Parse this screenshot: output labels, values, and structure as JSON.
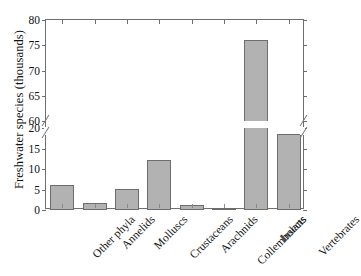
{
  "chart_data": {
    "type": "bar",
    "title": "",
    "xlabel": "",
    "ylabel": "Freshwater species (thousands)",
    "categories": [
      "Other phyla",
      "Annelids",
      "Molluscs",
      "Crustaceans",
      "Arachnids",
      "Collembolans",
      "Insects",
      "Vertebrates"
    ],
    "values": [
      6.1,
      1.8,
      5.1,
      12.2,
      1.2,
      0.4,
      76.0,
      18.6
    ],
    "ylim": [
      0,
      80
    ],
    "axis_break": {
      "present": true,
      "lower_segment": [
        0,
        20
      ],
      "upper_segment": [
        60,
        80
      ]
    },
    "yticks_lower": [
      "0",
      "5",
      "10",
      "15",
      "20"
    ],
    "yticks_upper": [
      "60",
      "65",
      "70",
      "75",
      "80"
    ],
    "grid": false,
    "legend": "none",
    "bar_fill_color": "#b2b2b2",
    "bar_edge_color": "#6d6d6d",
    "axis_color": "#6f6f6f",
    "background_color": "#ffffff"
  }
}
